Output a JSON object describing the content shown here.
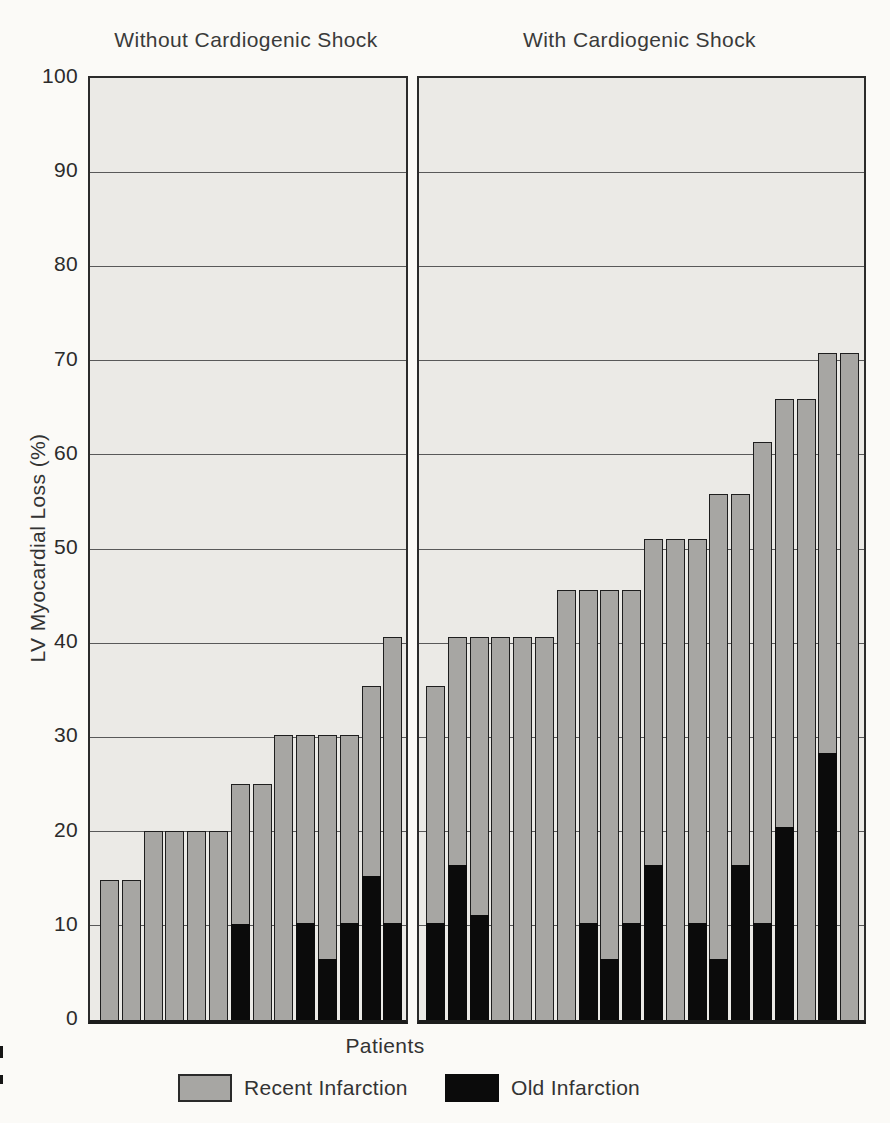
{
  "chart_data": {
    "type": "bar",
    "stacked": true,
    "xlabel": "Patients",
    "ylabel": "LV Myocardial Loss (%)",
    "ylim": [
      0,
      100
    ],
    "yticks": [
      0,
      10,
      20,
      30,
      40,
      50,
      60,
      70,
      80,
      90,
      100
    ],
    "grid": "horizontal",
    "legend_position": "bottom",
    "legend": [
      {
        "label": "Recent Infarction",
        "color": "#a7a6a3"
      },
      {
        "label": "Old Infarction",
        "color": "#0b0b0b"
      }
    ],
    "series_note": "Each bar is one patient; total bar height = total LV myocardial loss (%), black lower segment = old infarction portion, gray upper segment = recent infarction portion",
    "panels": [
      {
        "title": "Without Cardiogenic Shock",
        "patients": [
          {
            "total": 14.8,
            "old": 0
          },
          {
            "total": 14.8,
            "old": 0
          },
          {
            "total": 20.0,
            "old": 0
          },
          {
            "total": 20.0,
            "old": 0
          },
          {
            "total": 20.0,
            "old": 0
          },
          {
            "total": 20.0,
            "old": 0
          },
          {
            "total": 25.0,
            "old": 10.2
          },
          {
            "total": 25.0,
            "old": 0
          },
          {
            "total": 30.2,
            "old": 0
          },
          {
            "total": 30.2,
            "old": 10.3
          },
          {
            "total": 30.2,
            "old": 6.5
          },
          {
            "total": 30.2,
            "old": 10.3
          },
          {
            "total": 35.3,
            "old": 15.3
          },
          {
            "total": 40.6,
            "old": 10.3
          }
        ]
      },
      {
        "title": "With Cardiogenic Shock",
        "patients": [
          {
            "total": 35.3,
            "old": 10.3
          },
          {
            "total": 40.6,
            "old": 16.5
          },
          {
            "total": 40.6,
            "old": 11.2
          },
          {
            "total": 40.6,
            "old": 0
          },
          {
            "total": 40.6,
            "old": 0
          },
          {
            "total": 40.6,
            "old": 0
          },
          {
            "total": 45.5,
            "old": 0
          },
          {
            "total": 45.5,
            "old": 10.3
          },
          {
            "total": 45.5,
            "old": 6.5
          },
          {
            "total": 45.5,
            "old": 10.3
          },
          {
            "total": 51.0,
            "old": 16.5
          },
          {
            "total": 51.0,
            "old": 0
          },
          {
            "total": 51.0,
            "old": 10.3
          },
          {
            "total": 55.7,
            "old": 6.5
          },
          {
            "total": 55.7,
            "old": 16.5
          },
          {
            "total": 61.3,
            "old": 10.3
          },
          {
            "total": 65.8,
            "old": 20.5
          },
          {
            "total": 65.8,
            "old": 0
          },
          {
            "total": 70.7,
            "old": 28.3
          },
          {
            "total": 70.7,
            "old": 0
          }
        ]
      }
    ],
    "colors": {
      "recent_infarction": "#a7a6a3",
      "old_infarction": "#0b0b0b",
      "panel_background": "#ebeae6",
      "gridline": "#3f3f3f",
      "page_background": "#fbfaf7"
    }
  }
}
